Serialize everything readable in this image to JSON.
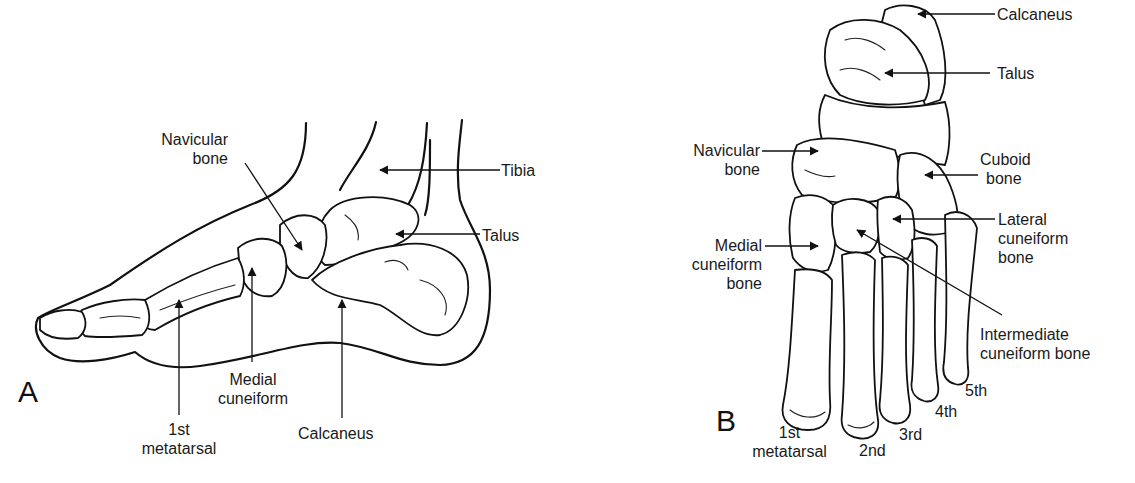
{
  "figure": {
    "panels": [
      {
        "id": "A",
        "letter": "A",
        "view": "medial lateral view of foot",
        "labels": {
          "navicular": [
            "Navicular",
            "bone"
          ],
          "tibia": "Tibia",
          "talus": "Talus",
          "medial_cuneiform": [
            "Medial",
            "cuneiform"
          ],
          "first_metatarsal": [
            "1st",
            "metatarsal"
          ],
          "calcaneus": "Calcaneus"
        }
      },
      {
        "id": "B",
        "letter": "B",
        "view": "dorsal view of foot bones",
        "labels": {
          "calcaneus": "Calcaneus",
          "talus": "Talus",
          "navicular": [
            "Navicular",
            "bone"
          ],
          "cuboid": [
            "Cuboid",
            "bone"
          ],
          "lateral_cuneiform": [
            "Lateral",
            "cuneiform",
            "bone"
          ],
          "medial_cuneiform": [
            "Medial",
            "cuneiform",
            "bone"
          ],
          "intermediate_cuneiform": [
            "Intermediate",
            "cuneiform bone"
          ],
          "metatarsals": {
            "first": [
              "1st",
              "metatarsal"
            ],
            "second": "2nd",
            "third": "3rd",
            "fourth": "4th",
            "fifth": "5th"
          }
        }
      }
    ]
  }
}
